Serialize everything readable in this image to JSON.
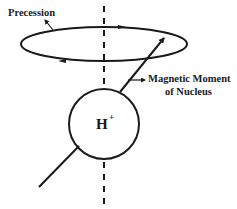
{
  "diagram": {
    "labels": {
      "precession": "Precession",
      "magnetic_moment_line1": "Magnetic Moment",
      "magnetic_moment_line2": "of Nucleus",
      "nucleus": "H",
      "nucleus_charge": "+"
    },
    "colors": {
      "stroke": "#1a1a1a",
      "background": "#ffffff"
    }
  }
}
